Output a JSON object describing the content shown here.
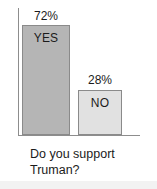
{
  "figure": {
    "width": 157,
    "height": 189,
    "background_color": "#ffffff"
  },
  "chart_data": {
    "type": "bar",
    "title": "",
    "subtitle": "",
    "categories": [
      "YES",
      "NO"
    ],
    "values": [
      72,
      28
    ],
    "value_labels": [
      "72%",
      "28%"
    ],
    "xlabel": "",
    "ylabel": "",
    "ylim": [
      0,
      100
    ],
    "grid": false,
    "legend": "none",
    "axis_color": "#8d8d8d",
    "series": [
      {
        "name": "Poll response share",
        "values": [
          72,
          28
        ]
      }
    ],
    "bars": [
      {
        "category": "YES",
        "value": 72,
        "value_label": "72%",
        "inner_label": "YES",
        "fill_color": "#b5b5b5",
        "border_color": "#8a8a8a"
      },
      {
        "category": "NO",
        "value": 28,
        "value_label": "28%",
        "inner_label": "NO",
        "fill_color": "#e1e1e1",
        "border_color": "#8a8a8a"
      }
    ],
    "annotations": [
      "Do you support",
      "Truman?"
    ]
  },
  "caption": {
    "line1": "Do you support",
    "line2": "Truman?",
    "full_text": "Do you support Truman?"
  }
}
